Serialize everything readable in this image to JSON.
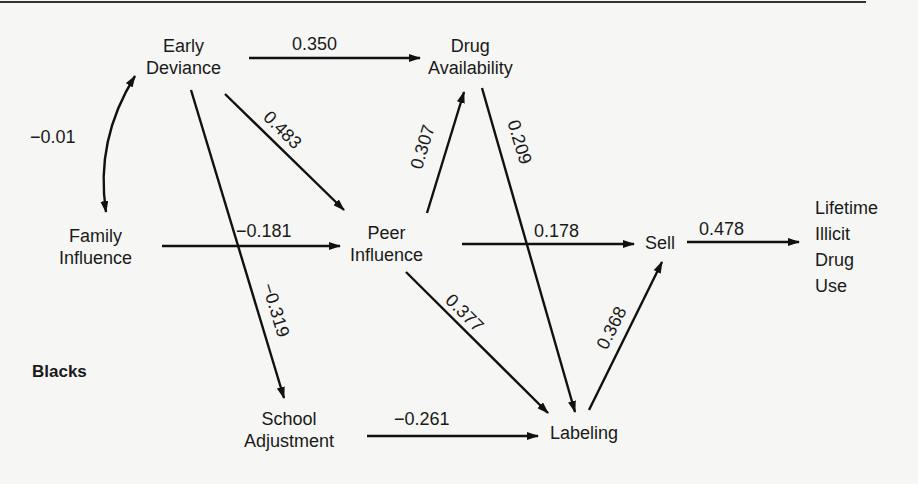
{
  "diagram": {
    "group_label": "Blacks",
    "nodes": {
      "early_deviance": [
        "Early",
        "Deviance"
      ],
      "drug_availability": [
        "Drug",
        "Availability"
      ],
      "family_influence": [
        "Family",
        "Influence"
      ],
      "peer_influence": [
        "Peer",
        "Influence"
      ],
      "sell": [
        "Sell"
      ],
      "lifetime_use": [
        "Lifetime",
        "Illicit",
        "Drug",
        "Use"
      ],
      "school_adjustment": [
        "School",
        "Adjustment"
      ],
      "labeling": [
        "Labeling"
      ]
    },
    "paths": [
      {
        "from": "Early Deviance",
        "to": "Family Influence",
        "coef": "−0.01",
        "type": "correlation"
      },
      {
        "from": "Early Deviance",
        "to": "Drug Availability",
        "coef": "0.350"
      },
      {
        "from": "Early Deviance",
        "to": "Peer Influence",
        "coef": "0.483"
      },
      {
        "from": "Early Deviance",
        "to": "School Adjustment",
        "coef": "−0.319"
      },
      {
        "from": "Family Influence",
        "to": "Peer Influence",
        "coef": "−0.181"
      },
      {
        "from": "Peer Influence",
        "to": "Drug Availability",
        "coef": "0.307"
      },
      {
        "from": "Drug Availability",
        "to": "Labeling",
        "coef": "0.209"
      },
      {
        "from": "Peer Influence",
        "to": "Sell",
        "coef": "0.178"
      },
      {
        "from": "Peer Influence",
        "to": "Labeling",
        "coef": "0.377"
      },
      {
        "from": "School Adjustment",
        "to": "Labeling",
        "coef": "−0.261"
      },
      {
        "from": "Labeling",
        "to": "Sell",
        "coef": "0.368"
      },
      {
        "from": "Sell",
        "to": "Lifetime Illicit Drug Use",
        "coef": "0.478"
      }
    ]
  }
}
